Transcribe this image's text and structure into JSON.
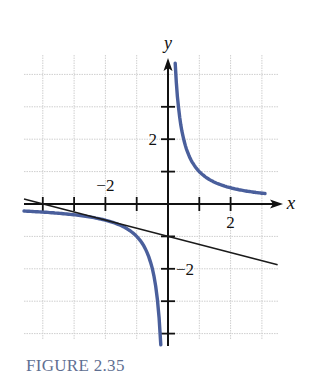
{
  "caption": "FIGURE 2.35",
  "colors": {
    "curve": "#4a5f9c",
    "line": "#1a1a1a",
    "axes": "#111111",
    "grid": "#cfcfcf",
    "caption": "#5f6f92"
  },
  "chart_data": {
    "type": "line",
    "title": "FIGURE 2.35",
    "xlabel": "x",
    "ylabel": "y",
    "xlim": [
      -4.6,
      3.5
    ],
    "ylim": [
      -4.2,
      4.5
    ],
    "grid": true,
    "x_ticks": [
      -4,
      -3,
      -2,
      -1,
      1,
      2
    ],
    "y_ticks": [
      -4,
      -3,
      -2,
      -1,
      1,
      2,
      3
    ],
    "x_tick_labels": [
      {
        "value": -2,
        "label": "−2"
      },
      {
        "value": 2,
        "label": "2"
      }
    ],
    "y_tick_labels": [
      {
        "value": 2,
        "label": "2"
      },
      {
        "value": -2,
        "label": "−2"
      }
    ],
    "series": [
      {
        "name": "curve y = 1/x (right branch)",
        "style": "thick blue",
        "x": [
          0.23,
          0.3,
          0.4,
          0.5,
          0.75,
          1,
          1.5,
          2,
          2.5,
          3,
          3.1
        ],
        "y": [
          4.35,
          3.33,
          2.5,
          2.0,
          1.33,
          1.0,
          0.67,
          0.5,
          0.4,
          0.33,
          0.32
        ]
      },
      {
        "name": "curve y = 1/x (left branch)",
        "style": "thick blue",
        "x": [
          -4.6,
          -4,
          -3,
          -2,
          -1.5,
          -1,
          -0.75,
          -0.5,
          -0.35,
          -0.28,
          -0.23
        ],
        "y": [
          -0.22,
          -0.25,
          -0.33,
          -0.5,
          -0.67,
          -1.0,
          -1.33,
          -2.0,
          -2.86,
          -3.57,
          -4.35
        ]
      },
      {
        "name": "tangent line y = -x/4 - 1 at (-2, -1/2)",
        "style": "thin black",
        "x": [
          -4.6,
          3.5
        ],
        "y": [
          0.15,
          -1.875
        ]
      }
    ],
    "annotations": []
  }
}
